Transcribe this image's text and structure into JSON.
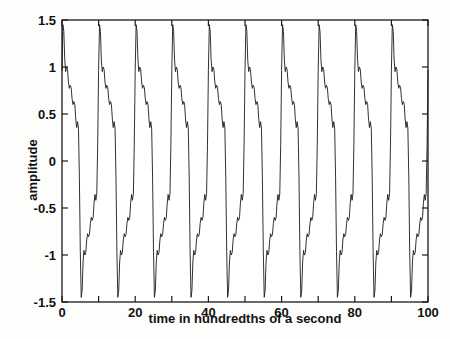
{
  "chart_data": {
    "type": "line",
    "title": "",
    "subtitle": "",
    "xlabel": "time in hundredths of a second",
    "ylabel": "amplitude",
    "xlim": [
      0,
      100
    ],
    "ylim": [
      -1.5,
      1.5
    ],
    "grid": false,
    "legend": null,
    "legend_position": "none",
    "x_ticks": [
      0,
      20,
      40,
      60,
      80,
      100
    ],
    "x_tick_labels": [
      "0",
      "20",
      "40",
      "60",
      "80",
      "100"
    ],
    "x_minor_ticks": [
      10,
      30,
      50,
      70,
      90
    ],
    "y_ticks": [
      -1.5,
      -1,
      -0.5,
      0,
      0.5,
      1,
      1.5
    ],
    "y_tick_labels": [
      "-1.5",
      "-1",
      "-0.5",
      "0",
      "0.5",
      "1",
      "1.5"
    ],
    "line_color": "#1a1a1a",
    "line_width": 0.9,
    "background_color": "#fdfdfb",
    "axes_color": "#1a1a1a",
    "series": [
      {
        "name": "waveform",
        "description": "periodic composite waveform, fundamental period 10 hundredths of a second, with higher harmonic ripple",
        "n_points": 401,
        "sample_step": 0.25,
        "period": 10,
        "peak_amplitude": 1.45,
        "trough_amplitude": -1.45,
        "harmonics": [
          {
            "frequency_per_unit": 0.1,
            "amplitude": 1.0,
            "phase_deg": 30
          },
          {
            "frequency_per_unit": 0.3,
            "amplitude": 0.33,
            "phase_deg": 30
          },
          {
            "frequency_per_unit": 0.5,
            "amplitude": 0.2,
            "phase_deg": 30
          },
          {
            "frequency_per_unit": 0.7,
            "amplitude": 0.143,
            "phase_deg": 30
          },
          {
            "frequency_per_unit": 0.9,
            "amplitude": 0.111,
            "phase_deg": 30
          }
        ],
        "start_value": 0.5,
        "end_value": -0.85
      }
    ]
  },
  "axes": {
    "x_tick_labels": [
      "0",
      "20",
      "40",
      "60",
      "80",
      "100"
    ],
    "y_tick_labels": [
      "1.5",
      "1",
      "0.5",
      "0",
      "-0.5",
      "-1",
      "-1.5"
    ],
    "xlabel": "time in hundredths of a second",
    "ylabel": "amplitude"
  }
}
